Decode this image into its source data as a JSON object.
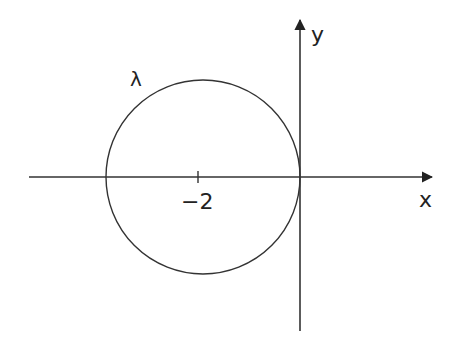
{
  "labels": {
    "x_axis": "x",
    "y_axis": "y",
    "circle": "λ",
    "center_tick": "−2"
  },
  "geometry": {
    "origin": [
      300,
      177
    ],
    "circle_center": [
      203,
      177
    ],
    "circle_radius": 97
  },
  "colors": {
    "stroke": "#333333",
    "background": "#ffffff"
  }
}
